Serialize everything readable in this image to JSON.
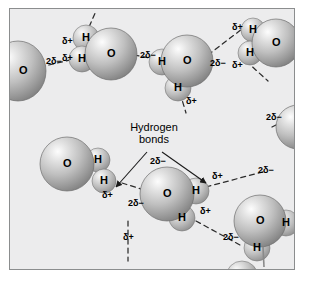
{
  "figure": {
    "type": "science-diagram",
    "background_color": "#ececed",
    "frame_color": "#8b8d8e",
    "page_color": "#ffffff"
  },
  "callout": {
    "line1": "Hydrogen",
    "line2": "bonds"
  },
  "symbols": {
    "oxygen": "O",
    "hydrogen": "H",
    "partial_positive": "δ",
    "partial_positive_sign": "+",
    "partial_negative_prefix": "2",
    "partial_negative": "δ",
    "partial_negative_sign": "−"
  },
  "molecules": [
    {
      "id": "mol-left-edge",
      "label": "water-molecule-left-edge",
      "oxygen": "O",
      "hydrogens": []
    },
    {
      "id": "mol-top-left",
      "label": "water-molecule-top-left",
      "oxygen": "O",
      "hydrogens": [
        "H",
        "H"
      ]
    },
    {
      "id": "mol-top-center",
      "label": "water-molecule-top-center",
      "oxygen": "O",
      "hydrogens": [
        "H",
        "H"
      ]
    },
    {
      "id": "mol-top-right",
      "label": "water-molecule-top-right",
      "oxygen": "O",
      "hydrogens": [
        "H",
        "H"
      ]
    },
    {
      "id": "mol-mid-left",
      "label": "water-molecule-mid-left",
      "oxygen": "O",
      "hydrogens": [
        "H",
        "H"
      ]
    },
    {
      "id": "mol-mid-center",
      "label": "water-molecule-mid-center",
      "oxygen": "O",
      "hydrogens": [
        "H",
        "H"
      ]
    },
    {
      "id": "mol-right-edge",
      "label": "water-molecule-right-edge",
      "oxygen": "",
      "hydrogens": []
    },
    {
      "id": "mol-bottom-right",
      "label": "water-molecule-bottom-right",
      "oxygen": "O",
      "hydrogens": [
        "H",
        "H"
      ]
    }
  ],
  "charge_labels": [
    {
      "id": "c01",
      "text": "2δ−",
      "kind": "negative",
      "near": "mol-left-edge"
    },
    {
      "id": "c02",
      "text": "δ+",
      "kind": "positive",
      "near": "mol-top-left"
    },
    {
      "id": "c03",
      "text": "δ+",
      "kind": "positive",
      "near": "mol-top-left"
    },
    {
      "id": "c04",
      "text": "2δ−",
      "kind": "negative",
      "near": "mol-top-left"
    },
    {
      "id": "c05",
      "text": "δ+",
      "kind": "positive",
      "near": "mol-top-right"
    },
    {
      "id": "c06",
      "text": "δ+",
      "kind": "positive",
      "near": "mol-top-right"
    },
    {
      "id": "c07",
      "text": "2δ−",
      "kind": "negative",
      "near": "mol-top-center"
    },
    {
      "id": "c08",
      "text": "δ+",
      "kind": "positive",
      "near": "mol-top-center"
    },
    {
      "id": "c09",
      "text": "δ+",
      "kind": "positive",
      "near": "mol-mid-left"
    },
    {
      "id": "c10",
      "text": "2δ−",
      "kind": "negative",
      "near": "mol-mid-center"
    },
    {
      "id": "c11",
      "text": "2δ−",
      "kind": "negative",
      "near": "mol-mid-center"
    },
    {
      "id": "c12",
      "text": "δ+",
      "kind": "positive",
      "near": "mol-mid-center"
    },
    {
      "id": "c13",
      "text": "δ+",
      "kind": "positive",
      "near": "mol-mid-center"
    },
    {
      "id": "c14",
      "text": "2δ−",
      "kind": "negative",
      "near": "mol-right-edge"
    },
    {
      "id": "c15",
      "text": "2δ−",
      "kind": "negative",
      "near": "mol-bottom-right"
    },
    {
      "id": "c16",
      "text": "δ+",
      "kind": "positive",
      "near": "mol-mid-center"
    },
    {
      "id": "c17",
      "text": "2δ−",
      "kind": "negative",
      "near": "mol-right-edge"
    }
  ],
  "atom_labels": [
    {
      "id": "a01",
      "text": "O",
      "molecule": "mol-left-edge"
    },
    {
      "id": "a02",
      "text": "H",
      "molecule": "mol-top-left"
    },
    {
      "id": "a03",
      "text": "H",
      "molecule": "mol-top-left"
    },
    {
      "id": "a04",
      "text": "O",
      "molecule": "mol-top-left"
    },
    {
      "id": "a05",
      "text": "H",
      "molecule": "mol-top-right"
    },
    {
      "id": "a06",
      "text": "H",
      "molecule": "mol-top-right"
    },
    {
      "id": "a07",
      "text": "O",
      "molecule": "mol-top-right"
    },
    {
      "id": "a08",
      "text": "H",
      "molecule": "mol-top-center"
    },
    {
      "id": "a09",
      "text": "O",
      "molecule": "mol-top-center"
    },
    {
      "id": "a10",
      "text": "H",
      "molecule": "mol-top-center"
    },
    {
      "id": "a11",
      "text": "O",
      "molecule": "mol-mid-left"
    },
    {
      "id": "a12",
      "text": "H",
      "molecule": "mol-mid-left"
    },
    {
      "id": "a13",
      "text": "H",
      "molecule": "mol-mid-left"
    },
    {
      "id": "a14",
      "text": "O",
      "molecule": "mol-mid-center"
    },
    {
      "id": "a15",
      "text": "H",
      "molecule": "mol-mid-center"
    },
    {
      "id": "a16",
      "text": "H",
      "molecule": "mol-mid-center"
    },
    {
      "id": "a17",
      "text": "O",
      "molecule": "mol-bottom-right"
    },
    {
      "id": "a18",
      "text": "H",
      "molecule": "mol-bottom-right"
    },
    {
      "id": "a19",
      "text": "H",
      "molecule": "mol-bottom-right"
    }
  ]
}
